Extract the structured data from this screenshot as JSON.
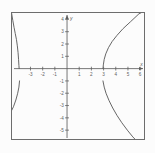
{
  "figure": {
    "kind": "coordinate-graph",
    "frame": {
      "x": 11,
      "y": 12,
      "width": 134,
      "height": 128,
      "border_color": "#5a5a5a"
    },
    "background_color": "#fdfdfd",
    "ink_color": "#4a4a4a"
  },
  "axes": {
    "x_axis_label": "x",
    "y_axis_label": "y",
    "origin_label": "",
    "x_ticks": [
      {
        "value": -3,
        "label": "-3"
      },
      {
        "value": -2,
        "label": "-2"
      },
      {
        "value": -1,
        "label": "-1"
      },
      {
        "value": 1,
        "label": "1"
      },
      {
        "value": 2,
        "label": "2"
      },
      {
        "value": 3,
        "label": "3"
      },
      {
        "value": 4,
        "label": "4"
      },
      {
        "value": 5,
        "label": "5"
      },
      {
        "value": 6,
        "label": "6"
      }
    ],
    "y_ticks": [
      {
        "value": 4,
        "label": "4"
      },
      {
        "value": 3,
        "label": "3"
      },
      {
        "value": 2,
        "label": "2"
      },
      {
        "value": 1,
        "label": "1"
      },
      {
        "value": -1,
        "label": "-1"
      },
      {
        "value": -2,
        "label": "-2"
      },
      {
        "value": -3,
        "label": "-3"
      },
      {
        "value": -4,
        "label": "-4"
      },
      {
        "value": -5,
        "label": "-5"
      }
    ]
  },
  "chart_data": {
    "type": "line",
    "title": "",
    "subtitle": "",
    "xlabel": "x",
    "ylabel": "y",
    "xlim": [
      -4.6,
      6.4
    ],
    "ylim": [
      -5.8,
      4.6
    ],
    "grid": false,
    "legend": false,
    "legend_position": "none",
    "annotations": [],
    "series": [
      {
        "name": "upper-left-branch",
        "points": [
          [
            -4.55,
            4.5
          ],
          [
            -4.45,
            3.9
          ],
          [
            -4.35,
            3.35
          ],
          [
            -4.25,
            2.85
          ],
          [
            -4.15,
            2.35
          ],
          [
            -4.08,
            1.85
          ],
          [
            -4.02,
            1.3
          ],
          [
            -3.98,
            0.75
          ],
          [
            -3.95,
            0.25
          ],
          [
            -3.93,
            0.0
          ]
        ]
      },
      {
        "name": "upper-right-branch",
        "points": [
          [
            2.95,
            0.0
          ],
          [
            2.98,
            0.3
          ],
          [
            3.05,
            0.75
          ],
          [
            3.18,
            1.2
          ],
          [
            3.4,
            1.7
          ],
          [
            3.7,
            2.2
          ],
          [
            4.1,
            2.7
          ],
          [
            4.6,
            3.25
          ],
          [
            5.2,
            3.8
          ],
          [
            5.9,
            4.45
          ],
          [
            6.2,
            4.6
          ]
        ]
      },
      {
        "name": "lower-left-branch",
        "points": [
          [
            -3.9,
            -1.0
          ],
          [
            -3.95,
            -1.5
          ],
          [
            -4.05,
            -2.0
          ],
          [
            -4.2,
            -2.55
          ],
          [
            -4.4,
            -3.1
          ],
          [
            -4.7,
            -3.7
          ],
          [
            -5.05,
            -4.3
          ],
          [
            -5.45,
            -4.9
          ],
          [
            -5.9,
            -5.5
          ],
          [
            -6.15,
            -5.8
          ]
        ]
      },
      {
        "name": "lower-right-branch",
        "points": [
          [
            2.95,
            -1.0
          ],
          [
            3.05,
            -1.5
          ],
          [
            3.2,
            -2.0
          ],
          [
            3.45,
            -2.6
          ],
          [
            3.75,
            -3.2
          ],
          [
            4.1,
            -3.8
          ],
          [
            4.5,
            -4.4
          ],
          [
            4.95,
            -5.0
          ],
          [
            5.4,
            -5.55
          ],
          [
            5.7,
            -5.85
          ]
        ]
      }
    ]
  }
}
